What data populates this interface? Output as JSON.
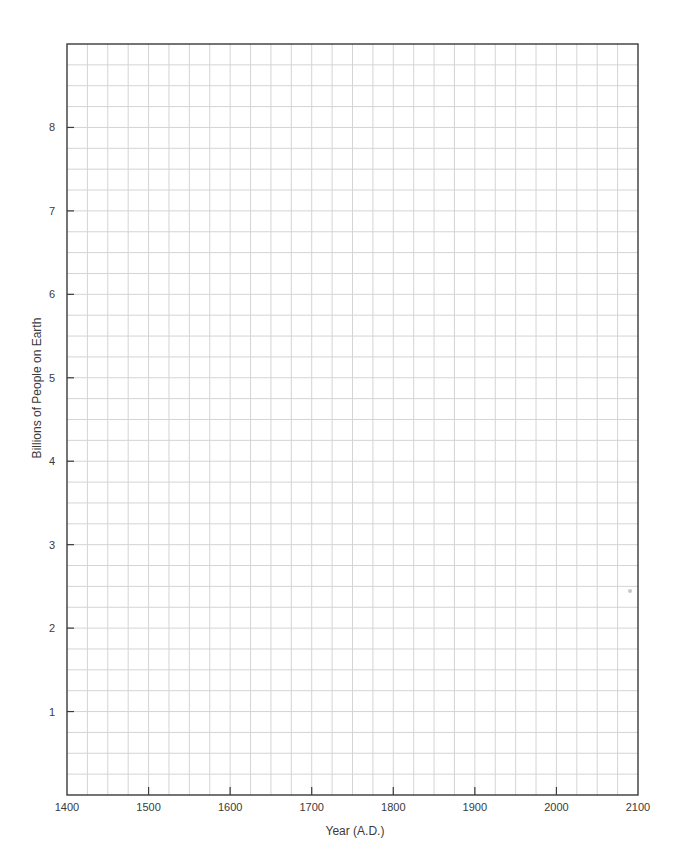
{
  "chart_data": {
    "type": "line",
    "title": "",
    "xlabel": "Year (A.D.)",
    "ylabel": "Billions of People on Earth",
    "xlim": [
      1400,
      2100
    ],
    "ylim": [
      0,
      9
    ],
    "x_ticks": [
      1400,
      1500,
      1600,
      1700,
      1800,
      1900,
      2000,
      2100
    ],
    "x_tick_labels": [
      "1400",
      "1500",
      "1600",
      "1700",
      "1800",
      "1900",
      "2000",
      "2100"
    ],
    "y_ticks": [
      1,
      2,
      3,
      4,
      5,
      6,
      7,
      8
    ],
    "y_tick_labels": [
      "1",
      "2",
      "3",
      "4",
      "5",
      "6",
      "7",
      "8"
    ],
    "grid": true,
    "grid_x_step": 25,
    "grid_y_step": 0.25,
    "legend": null,
    "series": []
  },
  "colors": {
    "axis": "#3a3a3a",
    "grid": "#d4d4d4",
    "text": "#3a3a3a",
    "background": "#ffffff"
  }
}
